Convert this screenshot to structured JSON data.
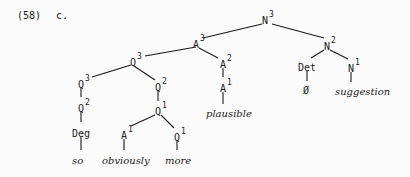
{
  "example": {
    "number": "(58)",
    "letter": "c."
  },
  "nodes": {
    "n3": {
      "cat": "N",
      "bar": "3"
    },
    "a3": {
      "cat": "A",
      "bar": "3"
    },
    "q3_top": {
      "cat": "Q",
      "bar": "3"
    },
    "q3_left": {
      "cat": "Q",
      "bar": "3"
    },
    "q2_left": {
      "cat": "Q",
      "bar": "2"
    },
    "deg": {
      "cat": "Deg",
      "bar": ""
    },
    "q2_right": {
      "cat": "Q",
      "bar": "2"
    },
    "q1_mid": {
      "cat": "Q",
      "bar": "1"
    },
    "a1_left": {
      "cat": "A",
      "bar": "1"
    },
    "q1_right": {
      "cat": "Q",
      "bar": "1"
    },
    "a2": {
      "cat": "A",
      "bar": "2"
    },
    "a1_right": {
      "cat": "A",
      "bar": "1"
    },
    "n2": {
      "cat": "N",
      "bar": "2"
    },
    "det": {
      "cat": "Det",
      "bar": ""
    },
    "n1": {
      "cat": "N",
      "bar": "1"
    }
  },
  "leaves": {
    "so": "so",
    "obviously": "obviously",
    "more": "more",
    "plausible": "plausible",
    "empty": "Ø",
    "suggestion": "suggestion"
  }
}
